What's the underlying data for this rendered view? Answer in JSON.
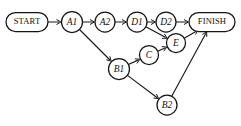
{
  "diagram": {
    "type": "directed-graph",
    "canvas": {
      "width": 241,
      "height": 126,
      "background": "#ffffff"
    },
    "style": {
      "line_color": "#18171a",
      "node_fill": "#ffffff",
      "node_stroke": "#141316"
    },
    "nodes": [
      {
        "id": "START",
        "label": "START",
        "shape": "stadium",
        "cx": 27,
        "cy": 22,
        "rx": 21,
        "ry": 9.5,
        "label_style": "terminal"
      },
      {
        "id": "A1",
        "label": "A1",
        "shape": "circle",
        "cx": 72,
        "cy": 22,
        "r": 10.5,
        "label_style": "italic"
      },
      {
        "id": "A2",
        "label": "A2",
        "shape": "circle",
        "cx": 105,
        "cy": 22,
        "r": 10,
        "label_style": "italic"
      },
      {
        "id": "D1",
        "label": "D1",
        "shape": "circle",
        "cx": 137,
        "cy": 22,
        "r": 10,
        "label_style": "italic"
      },
      {
        "id": "D2",
        "label": "D2",
        "shape": "circle",
        "cx": 166,
        "cy": 22,
        "r": 10,
        "label_style": "italic"
      },
      {
        "id": "FINISH",
        "label": "FINISH",
        "shape": "stadium",
        "cx": 212,
        "cy": 22,
        "rx": 23,
        "ry": 9.5,
        "label_style": "terminal"
      },
      {
        "id": "E",
        "label": "E",
        "shape": "circle",
        "cx": 176,
        "cy": 43,
        "r": 9.5,
        "label_style": "italic"
      },
      {
        "id": "C",
        "label": "C",
        "shape": "circle",
        "cx": 149,
        "cy": 55,
        "r": 9.5,
        "label_style": "italic"
      },
      {
        "id": "B1",
        "label": "B1",
        "shape": "circle",
        "cx": 119,
        "cy": 69,
        "r": 10.5,
        "label_style": "italic"
      },
      {
        "id": "B2",
        "label": "B2",
        "shape": "circle",
        "cx": 167,
        "cy": 105,
        "r": 10,
        "label_style": "italic"
      }
    ],
    "edges": [
      {
        "from": "START",
        "to": "A1",
        "name": "edge-start-a1"
      },
      {
        "from": "A1",
        "to": "A2",
        "name": "edge-a1-a2"
      },
      {
        "from": "A2",
        "to": "D1",
        "name": "edge-a2-d1"
      },
      {
        "from": "D1",
        "to": "D2",
        "name": "edge-d1-d2"
      },
      {
        "from": "D2",
        "to": "FINISH",
        "name": "edge-d2-finish"
      },
      {
        "from": "A1",
        "to": "B1",
        "name": "edge-a1-b1"
      },
      {
        "from": "B1",
        "to": "C",
        "name": "edge-b1-c"
      },
      {
        "from": "C",
        "to": "E",
        "name": "edge-c-e"
      },
      {
        "from": "D1",
        "to": "E",
        "name": "edge-d1-e"
      },
      {
        "from": "E",
        "to": "FINISH",
        "name": "edge-e-finish"
      },
      {
        "from": "B1",
        "to": "B2",
        "name": "edge-b1-b2"
      },
      {
        "from": "B2",
        "to": "FINISH",
        "name": "edge-b2-finish"
      }
    ]
  }
}
